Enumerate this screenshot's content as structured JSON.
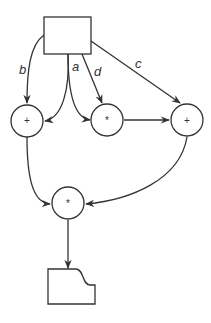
{
  "diagram": {
    "type": "dataflow",
    "nodes": {
      "source": {
        "shape": "rectangle",
        "label": ""
      },
      "add_left": {
        "shape": "circle",
        "op": "+"
      },
      "mul_mid": {
        "shape": "circle",
        "op": "*"
      },
      "add_right": {
        "shape": "circle",
        "op": "+"
      },
      "mul_bottom": {
        "shape": "circle",
        "op": "*"
      },
      "output": {
        "shape": "document",
        "label": ""
      }
    },
    "edge_labels": {
      "b": "b",
      "a": "a",
      "d": "d",
      "c": "c"
    },
    "edges": [
      {
        "from": "source",
        "to": "add_left",
        "label": "b"
      },
      {
        "from": "source",
        "to": "add_left",
        "label": "a"
      },
      {
        "from": "source",
        "to": "mul_mid",
        "label": "a"
      },
      {
        "from": "source",
        "to": "mul_mid",
        "label": "d"
      },
      {
        "from": "source",
        "to": "add_right",
        "label": "c"
      },
      {
        "from": "mul_mid",
        "to": "add_right",
        "label": ""
      },
      {
        "from": "add_left",
        "to": "mul_bottom",
        "label": ""
      },
      {
        "from": "add_right",
        "to": "mul_bottom",
        "label": ""
      },
      {
        "from": "mul_bottom",
        "to": "output",
        "label": ""
      }
    ]
  }
}
